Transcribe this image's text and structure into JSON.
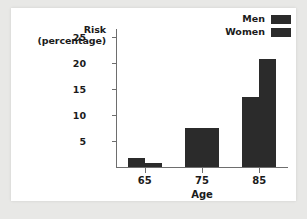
{
  "chart_data": {
    "type": "bar",
    "title": "",
    "categories": [
      "65",
      "75",
      "85"
    ],
    "series": [
      {
        "name": "Men",
        "values": [
          1.7,
          7.5,
          13.5
        ],
        "color": "#2b2b2b"
      },
      {
        "name": "Women",
        "values": [
          0.8,
          7.4,
          20.7
        ],
        "color": "#2b2b2b"
      }
    ],
    "xlabel": "Age",
    "ylabel": "Risk (percentage)",
    "ylabel_line1": "Risk",
    "ylabel_line2": "(percentage)",
    "yticks": [
      "5",
      "10",
      "15",
      "20",
      "25"
    ],
    "ylim": [
      0,
      26.5
    ],
    "grid": false,
    "legend_position": "top-right"
  },
  "legend": {
    "entries": [
      {
        "label": "Men"
      },
      {
        "label": "Women"
      }
    ]
  }
}
